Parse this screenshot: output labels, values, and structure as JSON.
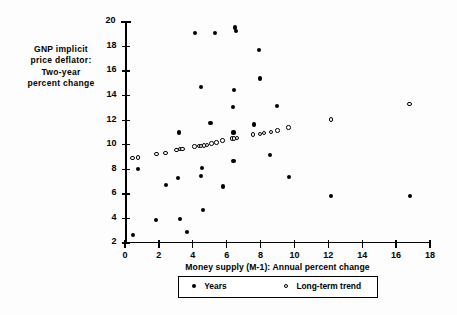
{
  "chart_data": {
    "type": "scatter",
    "title": "",
    "xlabel": "Money supply (M-1): Annual percent change",
    "ylabel": "GNP implicit price deflator: Two-year percent change",
    "ylabel_lines": [
      "GNP  implicit",
      "price  deflator:",
      "Two-year",
      "percent  change"
    ],
    "xlim": [
      0,
      18
    ],
    "ylim": [
      2,
      20
    ],
    "xticks": [
      0,
      2,
      4,
      6,
      8,
      10,
      12,
      14,
      16,
      18
    ],
    "yticks": [
      2,
      4,
      6,
      8,
      10,
      12,
      14,
      16,
      18,
      20
    ],
    "grid": false,
    "legend_position": "below-axis",
    "series": [
      {
        "name": "Years",
        "marker": "filled-circle",
        "color": "#000000",
        "points": [
          [
            0.45,
            2.65
          ],
          [
            0.75,
            8.0
          ],
          [
            1.85,
            3.85
          ],
          [
            2.4,
            6.75
          ],
          [
            3.15,
            7.3
          ],
          [
            3.25,
            3.95
          ],
          [
            3.2,
            11.0
          ],
          [
            3.65,
            2.9
          ],
          [
            4.15,
            19.1
          ],
          [
            4.5,
            14.7
          ],
          [
            4.55,
            8.1
          ],
          [
            4.6,
            4.7
          ],
          [
            4.5,
            7.45
          ],
          [
            5.05,
            11.75
          ],
          [
            5.3,
            19.1
          ],
          [
            5.8,
            6.6
          ],
          [
            6.35,
            13.1
          ],
          [
            6.4,
            8.65
          ],
          [
            6.5,
            19.55
          ],
          [
            6.55,
            19.3
          ],
          [
            6.45,
            14.45
          ],
          [
            6.4,
            11.0
          ],
          [
            7.6,
            11.65
          ],
          [
            7.9,
            17.7
          ],
          [
            7.95,
            15.4
          ],
          [
            8.55,
            9.15
          ],
          [
            8.95,
            13.15
          ],
          [
            9.7,
            7.35
          ],
          [
            12.15,
            5.8
          ],
          [
            16.8,
            5.8
          ]
        ]
      },
      {
        "name": "Long-term trend",
        "marker": "open-circle",
        "color": "#000000",
        "points": [
          [
            0.45,
            8.9
          ],
          [
            0.75,
            8.95
          ],
          [
            1.85,
            9.25
          ],
          [
            2.4,
            9.35
          ],
          [
            3.05,
            9.6
          ],
          [
            3.25,
            9.65
          ],
          [
            3.4,
            9.65
          ],
          [
            4.1,
            9.85
          ],
          [
            4.35,
            9.9
          ],
          [
            4.5,
            9.9
          ],
          [
            4.65,
            9.95
          ],
          [
            4.85,
            10.0
          ],
          [
            5.1,
            10.1
          ],
          [
            5.4,
            10.2
          ],
          [
            5.75,
            10.35
          ],
          [
            6.3,
            10.5
          ],
          [
            6.45,
            10.5
          ],
          [
            6.6,
            10.55
          ],
          [
            7.55,
            10.85
          ],
          [
            7.95,
            10.9
          ],
          [
            8.2,
            10.95
          ],
          [
            8.6,
            11.05
          ],
          [
            9.0,
            11.15
          ],
          [
            9.65,
            11.4
          ],
          [
            12.15,
            12.05
          ],
          [
            16.8,
            13.3
          ]
        ]
      }
    ],
    "annotations": []
  },
  "legend": {
    "years_label": "Years",
    "trend_label": "Long-term  trend"
  }
}
